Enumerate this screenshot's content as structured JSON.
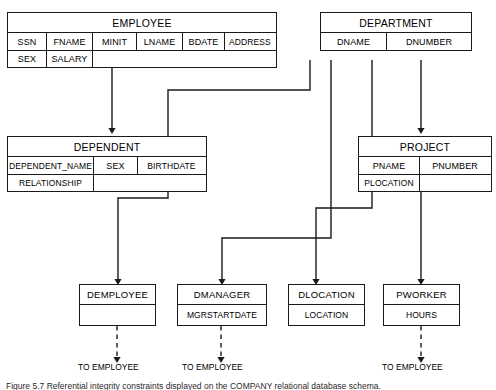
{
  "diagram": {
    "type": "relational-schema",
    "title_caption": "Figure 5.7 Referential integrity constraints displayed on the COMPANY relational database schema.",
    "line_color": "#1a1a1a",
    "background": "#ffffff"
  },
  "relations": [
    {
      "id": "employee",
      "name": "EMPLOYEE",
      "rows": [
        [
          "SSN",
          "FNAME",
          "MINIT",
          "LNAME",
          "BDATE",
          "ADDRESS"
        ],
        [
          "SEX",
          "SALARY"
        ]
      ]
    },
    {
      "id": "department",
      "name": "DEPARTMENT",
      "rows": [
        [
          "DNAME",
          "DNUMBER"
        ]
      ]
    },
    {
      "id": "dependent",
      "name": "DEPENDENT",
      "rows": [
        [
          "DEPENDENT_NAME",
          "SEX",
          "BIRTHDATE"
        ],
        [
          "RELATIONSHIP"
        ]
      ]
    },
    {
      "id": "project",
      "name": "PROJECT",
      "rows": [
        [
          "PNAME",
          "PNUMBER"
        ],
        [
          "PLOCATION"
        ]
      ]
    },
    {
      "id": "demployee",
      "name": "DEMPLOYEE",
      "rows": [
        [
          ""
        ]
      ]
    },
    {
      "id": "dmanager",
      "name": "DMANAGER",
      "rows": [
        [
          "MGRSTARTDATE"
        ]
      ]
    },
    {
      "id": "dlocation",
      "name": "DLOCATION",
      "rows": [
        [
          "LOCATION"
        ]
      ]
    },
    {
      "id": "pworker",
      "name": "PWORKER",
      "rows": [
        [
          "HOURS"
        ]
      ]
    }
  ],
  "reference_labels": [
    {
      "id": "to-employee-1",
      "text": "TO EMPLOYEE"
    },
    {
      "id": "to-employee-2",
      "text": "TO EMPLOYEE"
    },
    {
      "id": "to-employee-3",
      "text": "TO EMPLOYEE"
    }
  ]
}
